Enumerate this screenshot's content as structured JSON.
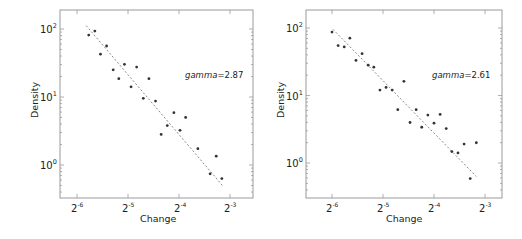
{
  "chart_data": [
    {
      "type": "scatter",
      "title": "",
      "xlabel": "Change",
      "ylabel": "Density",
      "xscale": "log2",
      "yscale": "log10",
      "xticks": [
        "2^-6",
        "2^-5",
        "2^-4",
        "2^-3"
      ],
      "yticks": [
        "10^0",
        "10^1",
        "10^2"
      ],
      "annotation": {
        "label": "gamma",
        "value": "2.87"
      },
      "fit_line": {
        "style": "dashed",
        "x_log2": [
          -5.82,
          -3.15
        ],
        "y_log10": [
          2.05,
          -0.3
        ]
      },
      "series": [
        {
          "name": "observed",
          "x_log2": [
            -5.77,
            -5.65,
            -5.54,
            -5.42,
            -5.29,
            -5.18,
            -5.07,
            -4.94,
            -4.83,
            -4.7,
            -4.59,
            -4.46,
            -4.35,
            -4.23,
            -4.1,
            -3.98,
            -3.87,
            -3.63,
            -3.39,
            -3.27,
            -3.16
          ],
          "y_log10": [
            1.91,
            1.97,
            1.63,
            1.75,
            1.4,
            1.27,
            1.48,
            1.15,
            1.44,
            0.98,
            1.27,
            0.94,
            0.45,
            0.58,
            0.77,
            0.51,
            0.7,
            0.24,
            -0.13,
            0.13,
            -0.2
          ]
        }
      ]
    },
    {
      "type": "scatter",
      "title": "",
      "xlabel": "Change",
      "ylabel": "Density",
      "xscale": "log2",
      "yscale": "log10",
      "xticks": [
        "2^-6",
        "2^-5",
        "2^-4",
        "2^-3"
      ],
      "yticks": [
        "10^0",
        "10^1",
        "10^2"
      ],
      "annotation": {
        "label": "gamma",
        "value": "2.61"
      },
      "fit_line": {
        "style": "dashed",
        "x_log2": [
          -5.98,
          -3.17
        ],
        "y_log10": [
          1.98,
          -0.2
        ]
      },
      "series": [
        {
          "name": "observed",
          "x_log2": [
            -6.0,
            -5.88,
            -5.76,
            -5.65,
            -5.53,
            -5.41,
            -5.29,
            -5.18,
            -5.06,
            -4.94,
            -4.82,
            -4.71,
            -4.59,
            -4.47,
            -4.35,
            -4.24,
            -4.12,
            -4.0,
            -3.88,
            -3.76,
            -3.65,
            -3.53,
            -3.41,
            -3.29,
            -3.17
          ],
          "y_log10": [
            1.94,
            1.74,
            1.72,
            1.85,
            1.52,
            1.62,
            1.45,
            1.42,
            1.08,
            1.12,
            1.08,
            0.79,
            1.21,
            0.6,
            0.79,
            0.53,
            0.71,
            0.59,
            0.72,
            0.51,
            0.17,
            0.15,
            0.28,
            -0.23,
            0.3
          ]
        }
      ]
    }
  ],
  "panels": [
    {
      "xlabel": "Change",
      "ylabel": "Density",
      "annotation_label": "gamma",
      "annotation_value": "=2.87",
      "xtick_base": "2",
      "xtick_exps": [
        "-6",
        "-5",
        "-4",
        "-3"
      ],
      "ytick_base": "10",
      "ytick_exps": [
        "2",
        "1",
        "0"
      ]
    },
    {
      "xlabel": "Change",
      "ylabel": "Density",
      "annotation_label": "gamma",
      "annotation_value": "=2.61",
      "xtick_base": "2",
      "xtick_exps": [
        "-6",
        "-5",
        "-4",
        "-3"
      ],
      "ytick_base": "10",
      "ytick_exps": [
        "2",
        "1",
        "0"
      ]
    }
  ],
  "colors": {
    "frame": "#9a9a9a",
    "point": "#333333",
    "fit_line": "#8a8a8a",
    "text": "#222222"
  }
}
